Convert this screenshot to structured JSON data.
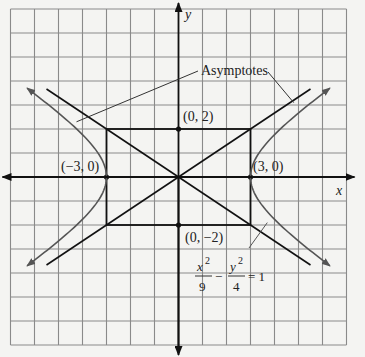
{
  "figure": {
    "x_axis_label": "x",
    "y_axis_label": "y",
    "callout_label": "Asymptotes",
    "points": [
      {
        "name": "top-vertex",
        "label": "(0, 2)",
        "x": 0,
        "y": 2
      },
      {
        "name": "bottom-vertex",
        "label": "(0, −2)",
        "x": 0,
        "y": -2
      },
      {
        "name": "left-vertex",
        "label": "(−3, 0)",
        "x": -3,
        "y": 0
      },
      {
        "name": "right-vertex",
        "label": "(3, 0)",
        "x": 3,
        "y": 0
      }
    ],
    "equation": {
      "term1_num": "x",
      "term1_exp": "2",
      "term1_den": "9",
      "minus": "−",
      "term2_num": "y",
      "term2_exp": "2",
      "term2_den": "4",
      "equals": "= 1"
    },
    "hyperbola": {
      "a": 3,
      "b": 2,
      "y_extent": 3.7
    },
    "asymptote_x_extent": 5.5,
    "grid": {
      "x_min": -7,
      "x_max": 7,
      "y_min": -7,
      "y_max": 7
    },
    "colors": {
      "grid": "#8a8a8a",
      "axis": "#111111",
      "curve": "#555555",
      "paper": "#f4f4f2"
    }
  }
}
